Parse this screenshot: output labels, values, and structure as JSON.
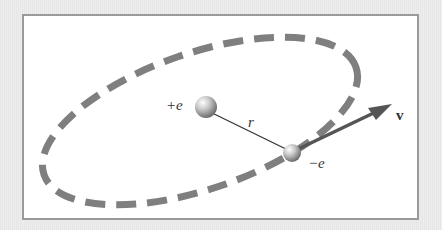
{
  "diagram": {
    "labels": {
      "nucleus_charge": "+e",
      "electron_charge": "−e",
      "radius": "r",
      "velocity": "v⃗"
    },
    "colors": {
      "orbit": "#7f7f7f",
      "vector": "#555555",
      "frame_border": "#9a9a9a",
      "background": "#e9e9e9"
    }
  }
}
